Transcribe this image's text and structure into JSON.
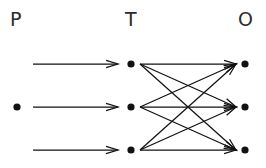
{
  "diagram": {
    "type": "layered-node-link-graph",
    "background_color": "#ffffff",
    "stroke_color": "#111111",
    "label_color": "#2b2b2b",
    "columns": [
      {
        "key": "P",
        "label": "P",
        "x": 17,
        "label_x": 10,
        "node_count": 1
      },
      {
        "key": "T",
        "label": "T",
        "x": 131,
        "label_x": 125,
        "node_count": 3
      },
      {
        "key": "O",
        "label": "O",
        "x": 245,
        "label_x": 238,
        "node_count": 3
      }
    ],
    "rows_y": [
      64,
      107,
      150
    ],
    "node_radius": 3.6,
    "nodes": [
      {
        "id": "P2",
        "column": "P",
        "row": 1,
        "cx": 17,
        "cy": 107
      },
      {
        "id": "T1",
        "column": "T",
        "row": 0,
        "cx": 131,
        "cy": 64
      },
      {
        "id": "T2",
        "column": "T",
        "row": 1,
        "cx": 131,
        "cy": 107
      },
      {
        "id": "T3",
        "column": "T",
        "row": 2,
        "cx": 131,
        "cy": 150
      },
      {
        "id": "O1",
        "column": "O",
        "row": 0,
        "cx": 245,
        "cy": 64
      },
      {
        "id": "O2",
        "column": "O",
        "row": 1,
        "cx": 245,
        "cy": 107
      },
      {
        "id": "O3",
        "column": "O",
        "row": 2,
        "cx": 245,
        "cy": 150
      }
    ],
    "edges_p_to_t": [
      {
        "id": "e-p-t-1",
        "x1": 33,
        "y1": 64,
        "x2": 118,
        "y2": 64
      },
      {
        "id": "e-p-t-2",
        "x1": 33,
        "y1": 107,
        "x2": 118,
        "y2": 107
      },
      {
        "id": "e-p-t-3",
        "x1": 33,
        "y1": 150,
        "x2": 118,
        "y2": 150
      }
    ],
    "edges_t_to_o": [
      {
        "id": "e-t1-o1",
        "from": "T1",
        "to": "O1",
        "x1": 140,
        "y1": 64,
        "x2": 236,
        "y2": 64
      },
      {
        "id": "e-t1-o2",
        "from": "T1",
        "to": "O2",
        "x1": 140,
        "y1": 64,
        "x2": 236,
        "y2": 107
      },
      {
        "id": "e-t1-o3",
        "from": "T1",
        "to": "O3",
        "x1": 140,
        "y1": 64,
        "x2": 236,
        "y2": 150
      },
      {
        "id": "e-t2-o1",
        "from": "T2",
        "to": "O1",
        "x1": 140,
        "y1": 107,
        "x2": 236,
        "y2": 64
      },
      {
        "id": "e-t2-o2",
        "from": "T2",
        "to": "O2",
        "x1": 140,
        "y1": 107,
        "x2": 236,
        "y2": 107
      },
      {
        "id": "e-t2-o3",
        "from": "T2",
        "to": "O3",
        "x1": 140,
        "y1": 107,
        "x2": 236,
        "y2": 150
      },
      {
        "id": "e-t3-o1",
        "from": "T3",
        "to": "O1",
        "x1": 140,
        "y1": 150,
        "x2": 236,
        "y2": 64
      },
      {
        "id": "e-t3-o2",
        "from": "T3",
        "to": "O2",
        "x1": 140,
        "y1": 150,
        "x2": 236,
        "y2": 107
      },
      {
        "id": "e-t3-o3",
        "from": "T3",
        "to": "O3",
        "x1": 140,
        "y1": 150,
        "x2": 236,
        "y2": 150
      }
    ],
    "notes": {
      "p_to_t_relation": "three parallel one-to-one arrows",
      "t_to_o_relation": "complete bipartite K3,3 all-to-all arrows"
    }
  }
}
